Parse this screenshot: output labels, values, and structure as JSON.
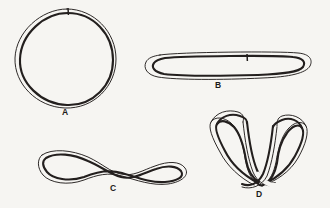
{
  "figure": {
    "background_color": "#f6f5f2",
    "ink_color": "#231f1e",
    "width": 330,
    "height": 208
  },
  "panels": [
    {
      "id": "A",
      "label": "A",
      "shape": "relaxed-closed-circle",
      "description": "Relaxed circular duplex drawn as a double contour ring with a nick tick mark at the top",
      "has_nick_mark": true,
      "label_x": 62,
      "label_y": 108
    },
    {
      "id": "B",
      "label": "B",
      "shape": "elongated-flattened-loop",
      "description": "Long narrow collapsed loop, stadium shaped, with a nick tick mark on the upper strand",
      "has_nick_mark": true,
      "label_x": 215,
      "label_y": 81
    },
    {
      "id": "C",
      "label": "C",
      "shape": "figure-eight-pinched-loop",
      "description": "Loop pinched in the middle forming a figure-eight / once twisted conformation",
      "has_nick_mark": false,
      "label_x": 110,
      "label_y": 184
    },
    {
      "id": "D",
      "label": "D",
      "shape": "supercoiled-interwound-loop",
      "description": "Interwound plectonemic supercoil with two large lobes and a strand crossing at the base",
      "has_nick_mark": false,
      "label_x": 256,
      "label_y": 190
    }
  ]
}
